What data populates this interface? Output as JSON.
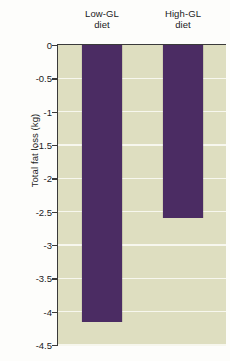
{
  "chart_data": {
    "type": "bar",
    "title": "",
    "xlabel": "",
    "ylabel": "Total fat loss (kg)",
    "categories": [
      "Low-GL\ndiet",
      "High-GL\ndiet"
    ],
    "values": [
      -4.15,
      -2.6
    ],
    "ylim": [
      -4.5,
      0
    ],
    "yticks": [
      0,
      -0.5,
      -1,
      -1.5,
      -2,
      -2.5,
      -3,
      -3.5,
      -4,
      -4.5
    ],
    "ytick_labels": [
      "0",
      "-0.5",
      "-1",
      "-1.5",
      "-2",
      "-2.5",
      "-3",
      "-3.5",
      "-4",
      "-4.5"
    ],
    "grid": true,
    "legend": "none",
    "colors": {
      "bar": "#4b2c63",
      "plot_background": "#dedec0",
      "gridline": "#f7f7ee",
      "axis": "#3a3a3a",
      "text": "#1b1b1b",
      "page_background": "#fdfdfb"
    }
  }
}
